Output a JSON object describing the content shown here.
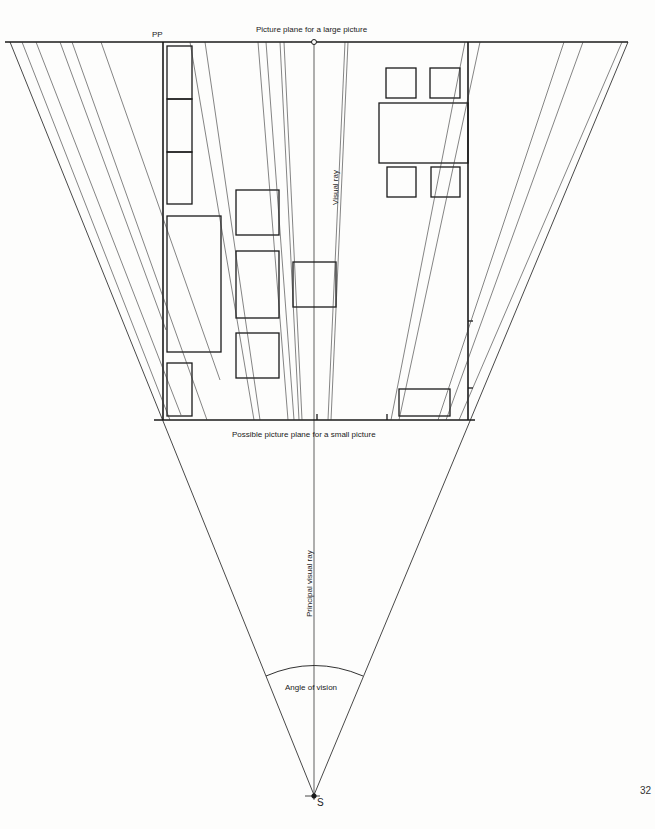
{
  "labels": {
    "pp": "PP",
    "large_plane": "Picture plane for a large picture",
    "small_plane": "Possible picture plane for a small picture",
    "visual_ray": "Visual ray",
    "principal_ray": "Principal visual ray",
    "angle": "Angle of vision",
    "station": "S",
    "page_number": "32"
  },
  "colors": {
    "ink": "#1a1a1a",
    "thin": "#333333",
    "paper": "#fdfdfc"
  }
}
